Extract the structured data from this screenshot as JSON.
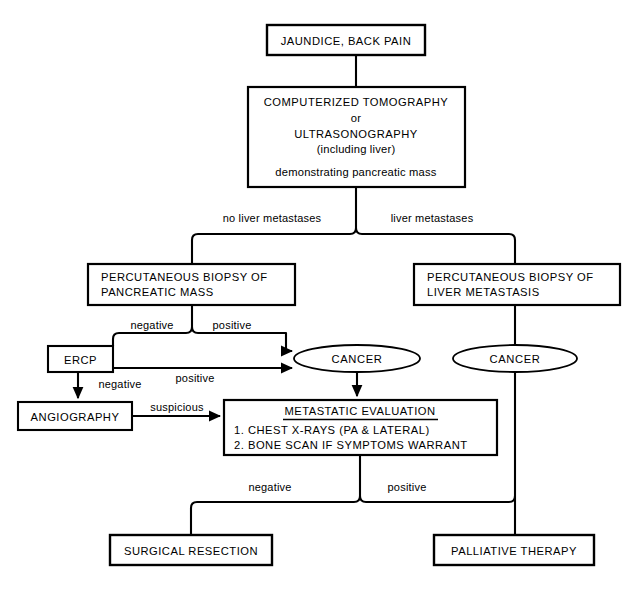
{
  "diagram": {
    "background_color": "#ffffff",
    "line_color": "#000000",
    "nodes": {
      "presentation": {
        "label": "JAUNDICE,  BACK  PAIN",
        "shape": "rect"
      },
      "imaging": {
        "line1": "COMPUTERIZED  TOMOGRAPHY",
        "line2": "or",
        "line3": "ULTRASONOGRAPHY",
        "line4": "(including  liver)",
        "line5": "demonstrating  pancreatic  mass",
        "shape": "rect"
      },
      "pancreatic_biopsy": {
        "line1": "PERCUTANEOUS  BIOPSY  OF",
        "line2": "PANCREATIC  MASS",
        "shape": "rect"
      },
      "liver_biopsy": {
        "line1": "PERCUTANEOUS  BIOPSY  OF",
        "line2": "LIVER  METASTASIS",
        "shape": "rect"
      },
      "ercp": {
        "label": "ERCP",
        "shape": "rect"
      },
      "angiography": {
        "label": "ANGIOGRAPHY",
        "shape": "rect"
      },
      "cancer_left": {
        "label": "CANCER",
        "shape": "ellipse"
      },
      "cancer_right": {
        "label": "CANCER",
        "shape": "ellipse"
      },
      "metastatic_evaluation": {
        "heading": "METASTATIC  EVALUATION",
        "item1": "1.  CHEST  X-RAYS  (PA & LATERAL)",
        "item2": "2.  BONE  SCAN  IF  SYMPTOMS  WARRANT",
        "shape": "rect"
      },
      "surgical_resection": {
        "label": "SURGICAL  RESECTION",
        "shape": "rect"
      },
      "palliative_therapy": {
        "label": "PALLIATIVE  THERAPY",
        "shape": "rect"
      }
    },
    "edge_labels": {
      "no_liver_metastases": "no  liver  metastases",
      "liver_metastases": "liver  metastases",
      "biopsy_negative": "negative",
      "biopsy_positive": "positive",
      "ercp_positive": "positive",
      "ercp_negative": "negative",
      "angio_suspicious": "suspicious",
      "eval_negative": "negative",
      "eval_positive": "positive"
    }
  }
}
